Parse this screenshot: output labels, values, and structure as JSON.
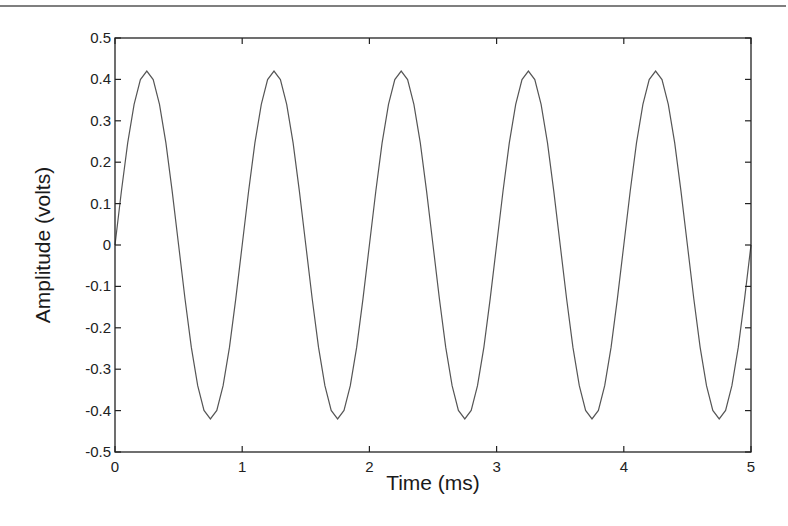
{
  "chart_data": {
    "type": "line",
    "title": "",
    "xlabel": "Time (ms)",
    "ylabel": "Amplitude (volts)",
    "xlim": [
      0,
      5
    ],
    "ylim": [
      -0.5,
      0.5
    ],
    "xticks": [
      "0",
      "1",
      "2",
      "3",
      "4",
      "5"
    ],
    "yticks": [
      "0.5",
      "0.4",
      "0.3",
      "0.2",
      "0.1",
      "0",
      "-0.1",
      "-0.2",
      "-0.3",
      "-0.4",
      "-0.5"
    ],
    "grid": false,
    "legend": null,
    "series": [
      {
        "name": "sine",
        "function": "0.42*sin(2*pi*t), t in ms",
        "amplitude": 0.42,
        "frequency_per_ms": 1,
        "samples_per_period": 20,
        "color": "#555555"
      }
    ]
  },
  "colors": {
    "axis": "#222222",
    "line": "#555555",
    "rule": "#444444"
  }
}
